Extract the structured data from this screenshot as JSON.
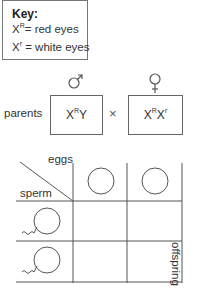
{
  "key": {
    "title": "Key:",
    "entries": [
      {
        "base": "X",
        "sup": "R",
        "text": "= red eyes"
      },
      {
        "base": "X",
        "sup": "r",
        "text": " = white eyes"
      }
    ]
  },
  "parents": {
    "label": "parents",
    "cross_symbol": "×",
    "male": {
      "symbol_icon": "male-symbol",
      "genotype_base1": "X",
      "genotype_sup1": "R",
      "genotype_rest": "Y"
    },
    "female": {
      "symbol_icon": "female-symbol",
      "genotype_base1": "X",
      "genotype_sup1": "R",
      "genotype_base2": "X",
      "genotype_sup2": "r"
    }
  },
  "punnett": {
    "eggs_label": "eggs",
    "sperm_label": "sperm",
    "offspring_label": "offspring",
    "egg_count": 2,
    "sperm_count": 2,
    "offspring_cells": [
      "",
      "",
      "",
      ""
    ]
  },
  "colors": {
    "line": "#555555",
    "text": "#333333",
    "background": "#ffffff"
  }
}
